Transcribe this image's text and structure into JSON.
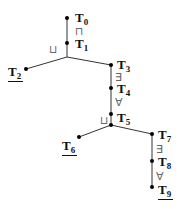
{
  "diagram": {
    "nodes": [
      {
        "id": "T0",
        "base": "T",
        "sub": "0",
        "underlined": false
      },
      {
        "id": "T1",
        "base": "T",
        "sub": "1",
        "underlined": false
      },
      {
        "id": "T2",
        "base": "T",
        "sub": "2",
        "underlined": true
      },
      {
        "id": "T3",
        "base": "T",
        "sub": "3",
        "underlined": false
      },
      {
        "id": "T4",
        "base": "T",
        "sub": "4",
        "underlined": false
      },
      {
        "id": "T5",
        "base": "T",
        "sub": "5",
        "underlined": false
      },
      {
        "id": "T6",
        "base": "T",
        "sub": "6",
        "underlined": true
      },
      {
        "id": "T7",
        "base": "T",
        "sub": "7",
        "underlined": false
      },
      {
        "id": "T8",
        "base": "T",
        "sub": "8",
        "underlined": false
      },
      {
        "id": "T9",
        "base": "T",
        "sub": "9",
        "underlined": true
      }
    ],
    "edges": [
      {
        "from": "T0",
        "to": "T1",
        "label": "⊓"
      },
      {
        "from": "T1",
        "to": "J1",
        "label": "⊔"
      },
      {
        "from": "J1",
        "to": "T2",
        "label": ""
      },
      {
        "from": "J1",
        "to": "T3",
        "label": ""
      },
      {
        "from": "T3",
        "to": "T4",
        "label": "∃"
      },
      {
        "from": "T4",
        "to": "T5",
        "label": "∀"
      },
      {
        "from": "T5",
        "to": "J2",
        "label": "⊔"
      },
      {
        "from": "J2",
        "to": "T6",
        "label": ""
      },
      {
        "from": "J2",
        "to": "T7",
        "label": ""
      },
      {
        "from": "T7",
        "to": "T8",
        "label": "∃"
      },
      {
        "from": "T8",
        "to": "T9",
        "label": "∀"
      }
    ],
    "operators": {
      "and": "⊓",
      "or": "⊔",
      "exists": "∃",
      "forall": "∀"
    }
  }
}
